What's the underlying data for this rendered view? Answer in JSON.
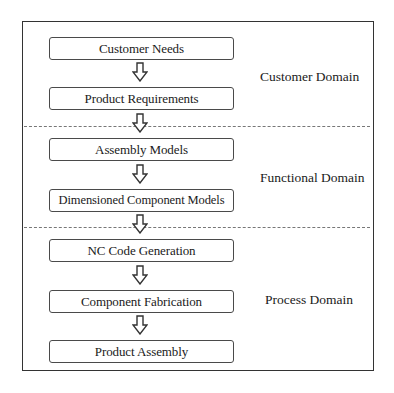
{
  "diagram": {
    "type": "flowchart",
    "direction": "top-to-bottom",
    "steps": [
      {
        "label": "Customer Needs",
        "domain": "Customer Domain"
      },
      {
        "label": "Product Requirements",
        "domain": "Customer Domain"
      },
      {
        "label": "Assembly Models",
        "domain": "Functional Domain"
      },
      {
        "label": "Dimensioned Component Models",
        "domain": "Functional Domain"
      },
      {
        "label": "NC Code Generation",
        "domain": "Process Domain"
      },
      {
        "label": "Component Fabrication",
        "domain": "Process Domain"
      },
      {
        "label": "Product Assembly",
        "domain": "Process Domain"
      }
    ],
    "domains": [
      {
        "label": "Customer Domain"
      },
      {
        "label": "Functional Domain"
      },
      {
        "label": "Process Domain"
      }
    ],
    "arrow_icon": "hollow-down-arrow-icon",
    "separator_style": "dashed",
    "colors": {
      "border": "#4a4a4a",
      "frame": "#333333",
      "dash": "#777777",
      "text": "#1a1a1a",
      "background": "#ffffff"
    }
  }
}
